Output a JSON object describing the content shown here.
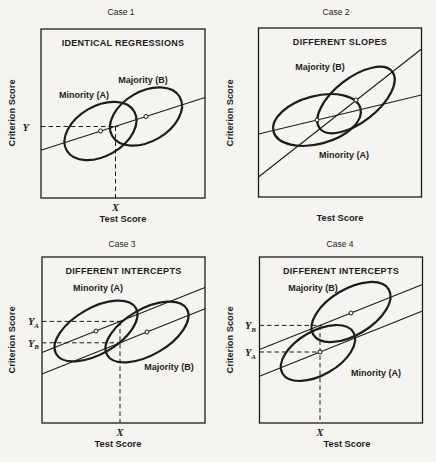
{
  "colors": {
    "paper": "#f5f4f1",
    "ink": "#1c1c1c"
  },
  "panels": [
    {
      "title": "Case 1",
      "header": "IDENTICAL REGRESSIONS",
      "minority_label": "Minority (A)",
      "majority_label": "Majority (B)",
      "x_axis_label": "Test Score",
      "y_axis_label": "Criterion Score",
      "x_cut_label": "X",
      "y_cut_label": "Y"
    },
    {
      "title": "Case 2",
      "header": "DIFFERENT SLOPES",
      "minority_label": "Minority (A)",
      "majority_label": "Majority (B)",
      "x_axis_label": "Test Score",
      "y_axis_label": "Criterion Score"
    },
    {
      "title": "Case 3",
      "header": "DIFFERENT INTERCEPTS",
      "minority_label": "Minority (A)",
      "majority_label": "Majority (B)",
      "x_axis_label": "Test Score",
      "y_axis_label": "Criterion Score",
      "x_cut_label": "X",
      "y_cut_a": {
        "base": "Y",
        "sub": "A"
      },
      "y_cut_b": {
        "base": "Y",
        "sub": "B"
      }
    },
    {
      "title": "Case 4",
      "header": "DIFFERENT INTERCEPTS",
      "minority_label": "Minority (A)",
      "majority_label": "Majority (B)",
      "x_axis_label": "Test Score",
      "y_axis_label": "Criterion Score",
      "x_cut_label": "X",
      "y_cut_a": {
        "base": "Y",
        "sub": "A"
      },
      "y_cut_b": {
        "base": "Y",
        "sub": "B"
      }
    }
  ]
}
